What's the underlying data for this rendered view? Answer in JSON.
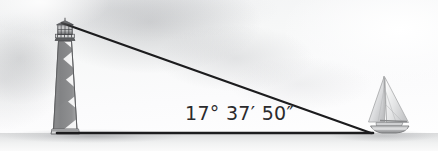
{
  "figure": {
    "type": "geometry-illustration",
    "alt": "A striped lighthouse on the left and a sailboat on the right, joined by a right triangle whose interior angle at the boat is labeled 17 degrees 37 minutes 50 seconds.",
    "background_color": "#f7f8f8",
    "ground_color": "#e6e7e8",
    "line_color": "#1c1c1e",
    "text_color": "#2b2b2d"
  },
  "angle": {
    "label": "17° 37′ 50″",
    "degrees": 17,
    "minutes": 37,
    "seconds": 50,
    "vertex": "sailboat",
    "decimal_degrees": 17.630555
  },
  "triangle": {
    "apex_label": "lighthouse-lamp",
    "base_left_label": "lighthouse-base",
    "base_right_label": "sailboat",
    "apex": {
      "x": 62,
      "y": 23
    },
    "base_left": {
      "x": 62,
      "y": 133
    },
    "base_right": {
      "x": 371,
      "y": 133
    }
  },
  "objects": {
    "lighthouse": {
      "name": "lighthouse",
      "pattern": "spiral-stripe",
      "stripe_dark": "#6d6e71",
      "stripe_light": "#f0f0f0",
      "parts": [
        "lantern-room",
        "gallery-railing",
        "tower",
        "base"
      ]
    },
    "sailboat": {
      "name": "sailboat",
      "sail_color": "#e8e9ea",
      "hull_color": "#bdbec0",
      "parts": [
        "mainsail",
        "jib",
        "mast",
        "hull"
      ]
    }
  }
}
